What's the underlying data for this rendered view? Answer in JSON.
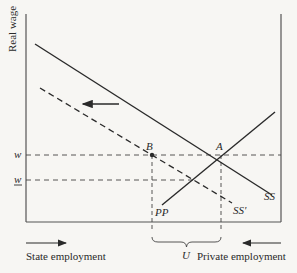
{
  "diagram": {
    "y_axis_label": "Real wage",
    "wage_level_label": "w",
    "lower_wage_label": "w",
    "point_a_label": "A",
    "point_b_label": "B",
    "curve_ss_label": "SS",
    "curve_ss_prime_label": "SS'",
    "curve_pp_label": "PP",
    "unemployment_label": "U",
    "left_axis_caption": "State employment",
    "right_axis_caption": "Private employment",
    "colors": {
      "line": "#2a2a2a",
      "background": "#f7f6f3"
    }
  }
}
